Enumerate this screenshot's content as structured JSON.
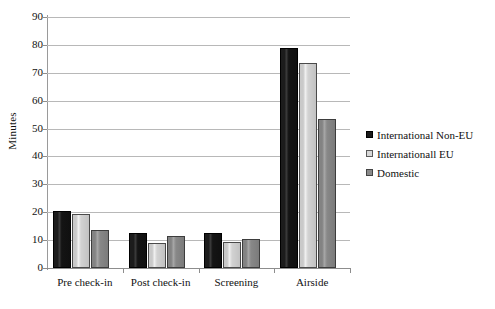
{
  "chart_data": {
    "type": "bar",
    "title": "",
    "xlabel": "",
    "ylabel": "Minutes",
    "ylim": [
      0,
      90
    ],
    "ytick_step": 10,
    "yticks": [
      90,
      80,
      70,
      60,
      50,
      40,
      30,
      20,
      10,
      0
    ],
    "grid": "horizontal",
    "legend_position": "right",
    "categories": [
      "Pre check-in",
      "Post check-in",
      "Screening",
      "Airside"
    ],
    "series": [
      {
        "name": "International Non-EU",
        "color": "#1a1a1a",
        "values": [
          20.5,
          12.5,
          12.5,
          79
        ]
      },
      {
        "name": "Internationall EU",
        "color": "#d8d8d8",
        "values": [
          19.5,
          9,
          9.5,
          73.5
        ]
      },
      {
        "name": "Domestic",
        "color": "#8a8a8a",
        "values": [
          13.5,
          11.5,
          10.5,
          53.5
        ]
      }
    ]
  }
}
